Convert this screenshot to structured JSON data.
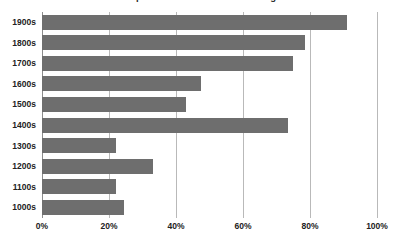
{
  "chart_data": {
    "type": "bar",
    "orientation": "horizontal",
    "title": "Proportion of Records Containing",
    "xlabel": "",
    "ylabel": "",
    "categories": [
      "1900s",
      "1800s",
      "1700s",
      "1600s",
      "1500s",
      "1400s",
      "1300s",
      "1200s",
      "1100s",
      "1000s"
    ],
    "values": [
      91,
      78.5,
      75,
      47.5,
      43,
      73.5,
      22,
      33,
      22,
      24.5
    ],
    "value_suffix": "%",
    "xlim": [
      0,
      100
    ],
    "xticks": [
      0,
      20,
      40,
      60,
      80,
      100
    ],
    "xtick_labels": [
      "0%",
      "20%",
      "40%",
      "60%",
      "80%",
      "100%"
    ],
    "grid": "vertical",
    "legend": "none",
    "bar_color": "#6e6e6e",
    "gridline_color": "#b9b9b9",
    "axis_color": "#8d8d8d",
    "background_color": "#ffffff"
  }
}
